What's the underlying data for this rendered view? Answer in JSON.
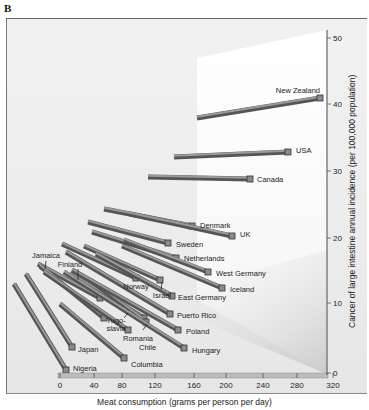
{
  "figure_label": "B",
  "chart_data": {
    "type": "bar",
    "style": "3d-perspective-bars",
    "title": "",
    "xlabel": "Meat consumption (grams per person per day)",
    "ylabel": "Cancer of large intestine annual incidence (per 100,000 population)",
    "xticks": [
      0,
      40,
      80,
      120,
      160,
      200,
      240,
      280,
      320
    ],
    "yticks": [
      0,
      10,
      20,
      30,
      40,
      50
    ],
    "xlim": [
      0,
      320
    ],
    "ylim": [
      0,
      50
    ],
    "grid": false,
    "legend": null,
    "series": [
      {
        "name": "Nigeria",
        "meat": 5,
        "cancer": 1
      },
      {
        "name": "Japan",
        "meat": 20,
        "cancer": 3
      },
      {
        "name": "Columbia",
        "meat": 80,
        "cancer": 2
      },
      {
        "name": "Chile",
        "meat": 80,
        "cancer": 4
      },
      {
        "name": "Hungary",
        "meat": 140,
        "cancer": 3
      },
      {
        "name": "Poland",
        "meat": 140,
        "cancer": 6
      },
      {
        "name": "Romania",
        "meat": 100,
        "cancer": 7
      },
      {
        "name": "Yugoslavia",
        "meat": 60,
        "cancer": 8
      },
      {
        "name": "Puerto Rico",
        "meat": 165,
        "cancer": 8
      },
      {
        "name": "Jamaica",
        "meat": 15,
        "cancer": 13
      },
      {
        "name": "Finland",
        "meat": 75,
        "cancer": 12
      },
      {
        "name": "Norway",
        "meat": 100,
        "cancer": 13
      },
      {
        "name": "Israel",
        "meat": 120,
        "cancer": 13
      },
      {
        "name": "East Germany",
        "meat": 145,
        "cancer": 11
      },
      {
        "name": "Iceland",
        "meat": 210,
        "cancer": 12
      },
      {
        "name": "West Germany",
        "meat": 185,
        "cancer": 14
      },
      {
        "name": "Netherlands",
        "meat": 150,
        "cancer": 17
      },
      {
        "name": "Sweden",
        "meat": 135,
        "cancer": 18
      },
      {
        "name": "UK",
        "meat": 205,
        "cancer": 20
      },
      {
        "name": "Denmark",
        "meat": 170,
        "cancer": 22
      },
      {
        "name": "Canada",
        "meat": 250,
        "cancer": 29
      },
      {
        "name": "USA",
        "meat": 280,
        "cancer": 32
      },
      {
        "name": "New Zealand",
        "meat": 310,
        "cancer": 41
      }
    ]
  },
  "render": {
    "bars": [
      {
        "name": "Nigeria",
        "x1": 14,
        "y1": 284,
        "x2": 66,
        "y2": 370,
        "lx": 73,
        "ly": 371,
        "anchor": "start"
      },
      {
        "name": "Japan",
        "x1": 26,
        "y1": 274,
        "x2": 72,
        "y2": 347,
        "lx": 78,
        "ly": 352,
        "anchor": "start"
      },
      {
        "name": "Columbia",
        "x1": 60,
        "y1": 304,
        "x2": 124,
        "y2": 358,
        "lx": 131,
        "ly": 367,
        "anchor": "start"
      },
      {
        "name": "Chile",
        "x1": 44,
        "y1": 272,
        "x2": 128,
        "y2": 330,
        "lx": 139,
        "ly": 350,
        "anchor": "start"
      },
      {
        "name": "Hungary",
        "x1": 64,
        "y1": 272,
        "x2": 184,
        "y2": 348,
        "lx": 192,
        "ly": 353,
        "anchor": "start"
      },
      {
        "name": "Poland",
        "x1": 72,
        "y1": 270,
        "x2": 178,
        "y2": 330,
        "lx": 186,
        "ly": 334,
        "anchor": "start"
      },
      {
        "name": "Romania",
        "x1": 90,
        "y1": 280,
        "x2": 146,
        "y2": 322,
        "lx": 138,
        "ly": 341,
        "anchor": "middle"
      },
      {
        "name": "Yugoslavia",
        "x1": 40,
        "y1": 266,
        "x2": 104,
        "y2": 318,
        "lx": 116,
        "ly": 323,
        "anchor": "middle"
      },
      {
        "name": "Puerto Rico",
        "x1": 66,
        "y1": 252,
        "x2": 170,
        "y2": 314,
        "lx": 177,
        "ly": 318,
        "anchor": "start"
      },
      {
        "name": "Jamaica",
        "x1": 38,
        "y1": 264,
        "x2": 100,
        "y2": 298,
        "lx": 46,
        "ly": 258,
        "anchor": "middle"
      },
      {
        "name": "Finland",
        "x1": 70,
        "y1": 274,
        "x2": 144,
        "y2": 318,
        "lx": 70,
        "ly": 267,
        "anchor": "middle"
      },
      {
        "name": "Norway",
        "x1": 62,
        "y1": 244,
        "x2": 136,
        "y2": 278,
        "lx": 136,
        "ly": 289,
        "anchor": "middle"
      },
      {
        "name": "Israel",
        "x1": 84,
        "y1": 246,
        "x2": 160,
        "y2": 280,
        "lx": 162,
        "ly": 298,
        "anchor": "middle"
      },
      {
        "name": "East Germany",
        "x1": 96,
        "y1": 254,
        "x2": 172,
        "y2": 296,
        "lx": 178,
        "ly": 300,
        "anchor": "start"
      },
      {
        "name": "Iceland",
        "x1": 122,
        "y1": 246,
        "x2": 222,
        "y2": 288,
        "lx": 230,
        "ly": 292,
        "anchor": "start"
      },
      {
        "name": "West Germany",
        "x1": 124,
        "y1": 240,
        "x2": 208,
        "y2": 272,
        "lx": 216,
        "ly": 276,
        "anchor": "start"
      },
      {
        "name": "Netherlands",
        "x1": 92,
        "y1": 232,
        "x2": 176,
        "y2": 258,
        "lx": 184,
        "ly": 261,
        "anchor": "start"
      },
      {
        "name": "Sweden",
        "x1": 88,
        "y1": 222,
        "x2": 168,
        "y2": 243,
        "lx": 176,
        "ly": 247,
        "anchor": "start"
      },
      {
        "name": "UK",
        "x1": 130,
        "y1": 214,
        "x2": 232,
        "y2": 236,
        "lx": 240,
        "ly": 237,
        "anchor": "start"
      },
      {
        "name": "Denmark",
        "x1": 104,
        "y1": 209,
        "x2": 192,
        "y2": 226,
        "lx": 200,
        "ly": 228,
        "anchor": "start"
      },
      {
        "name": "Canada",
        "x1": 148,
        "y1": 177,
        "x2": 250,
        "y2": 179,
        "lx": 257,
        "ly": 182,
        "anchor": "start"
      },
      {
        "name": "USA",
        "x1": 174,
        "y1": 157,
        "x2": 288,
        "y2": 152,
        "lx": 296,
        "ly": 153,
        "anchor": "start"
      },
      {
        "name": "New Zealand",
        "x1": 197,
        "y1": 118,
        "x2": 320,
        "y2": 98,
        "lx": 320,
        "ly": 93,
        "anchor": "end"
      }
    ],
    "leaders": [
      {
        "name": "Jamaica",
        "x1": 46,
        "y1": 261,
        "x2": 45,
        "y2": 269
      },
      {
        "name": "Finland",
        "x1": 78,
        "y1": 269,
        "x2": 78,
        "y2": 280
      },
      {
        "name": "Israel",
        "x1": 162,
        "y1": 282,
        "x2": 161,
        "y2": 290
      },
      {
        "name": "Yugoslavia",
        "x1": 124,
        "y1": 318,
        "x2": 128,
        "y2": 313
      },
      {
        "name": "Romania",
        "x1": 143,
        "y1": 330,
        "x2": 147,
        "y2": 324
      }
    ],
    "xaxis": {
      "y": 376,
      "ticks_px": [
        60,
        94,
        122,
        155,
        194,
        226,
        263,
        297,
        333
      ],
      "label_y": 388
    },
    "yaxis": {
      "x": 327,
      "ticks_px": [
        373,
        303,
        238,
        171,
        104,
        38
      ]
    }
  }
}
